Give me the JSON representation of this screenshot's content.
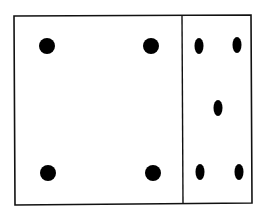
{
  "diagram": {
    "stroke_color": "#111111",
    "fill_color": "#000000",
    "background": "#ffffff",
    "outer_frame": {
      "x1": 14,
      "y1": 16,
      "x2": 251,
      "y2": 204
    },
    "divider_x": 182,
    "left_panel": {
      "dot_count": 4,
      "dot_shape": "circle",
      "dots": [
        {
          "cx": 47,
          "cy": 46,
          "r": 8
        },
        {
          "cx": 151,
          "cy": 46,
          "r": 8
        },
        {
          "cx": 48,
          "cy": 173,
          "r": 8
        },
        {
          "cx": 153,
          "cy": 173,
          "r": 8
        }
      ]
    },
    "right_panel": {
      "dot_count": 5,
      "dot_shape": "ellipse",
      "dots": [
        {
          "cx": 199,
          "cy": 46,
          "rx": 4.5,
          "ry": 8
        },
        {
          "cx": 237,
          "cy": 45,
          "rx": 4.5,
          "ry": 8
        },
        {
          "cx": 218,
          "cy": 108,
          "rx": 4.5,
          "ry": 8
        },
        {
          "cx": 200,
          "cy": 172,
          "rx": 4.5,
          "ry": 8
        },
        {
          "cx": 239,
          "cy": 172,
          "rx": 4.5,
          "ry": 8
        }
      ]
    }
  }
}
